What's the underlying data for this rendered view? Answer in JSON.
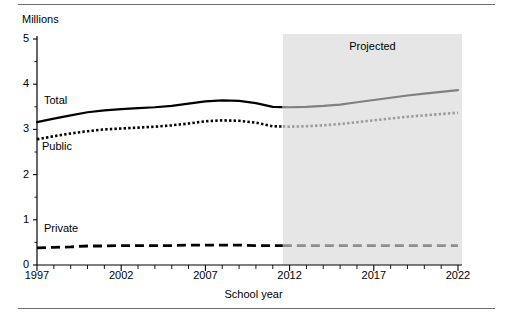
{
  "chart_data": {
    "type": "line",
    "title": "",
    "ylabel": "Millions",
    "xlabel": "School year",
    "xlim": [
      1997,
      2022
    ],
    "ylim": [
      0,
      5
    ],
    "grid": false,
    "legend_position": "inline-labels",
    "y_ticks": [
      "0",
      "1",
      "2",
      "3",
      "4",
      "5"
    ],
    "y_tick_values": [
      0,
      1,
      2,
      3,
      4,
      5
    ],
    "x_ticks": [
      "1997",
      "2002",
      "2007",
      "2012",
      "2017",
      "2022"
    ],
    "x_tick_values": [
      1997,
      2002,
      2007,
      2012,
      2017,
      2022
    ],
    "annotations": [
      {
        "name": "projected-label",
        "text": "Projected",
        "start_year": 2011.6,
        "end_year": 2022
      }
    ],
    "projection_start_year": 2011.6,
    "x": [
      1997,
      1998,
      1999,
      2000,
      2001,
      2002,
      2003,
      2004,
      2005,
      2006,
      2007,
      2008,
      2009,
      2010,
      2011,
      2012,
      2013,
      2014,
      2015,
      2016,
      2017,
      2018,
      2019,
      2020,
      2021,
      2022
    ],
    "series": [
      {
        "name": "Total",
        "label": "Total",
        "color": "#000000",
        "projected_color": "#808080",
        "style": "solid",
        "values": [
          3.16,
          3.24,
          3.31,
          3.38,
          3.42,
          3.45,
          3.47,
          3.49,
          3.52,
          3.57,
          3.62,
          3.64,
          3.63,
          3.58,
          3.5,
          3.49,
          3.5,
          3.52,
          3.55,
          3.6,
          3.65,
          3.7,
          3.75,
          3.79,
          3.83,
          3.87
        ]
      },
      {
        "name": "Public",
        "label": "Public",
        "color": "#000000",
        "projected_color": "#9a9a9a",
        "style": "dotted",
        "values": [
          2.78,
          2.85,
          2.91,
          2.96,
          3.0,
          3.02,
          3.04,
          3.06,
          3.09,
          3.13,
          3.18,
          3.2,
          3.19,
          3.15,
          3.07,
          3.06,
          3.07,
          3.09,
          3.12,
          3.16,
          3.2,
          3.24,
          3.28,
          3.31,
          3.34,
          3.37
        ]
      },
      {
        "name": "Private",
        "label": "Private",
        "color": "#000000",
        "projected_color": "#8e8e8e",
        "style": "dashed",
        "values": [
          0.38,
          0.39,
          0.4,
          0.42,
          0.42,
          0.43,
          0.43,
          0.43,
          0.43,
          0.44,
          0.44,
          0.44,
          0.44,
          0.43,
          0.43,
          0.43,
          0.43,
          0.43,
          0.43,
          0.43,
          0.43,
          0.43,
          0.43,
          0.43,
          0.43,
          0.43
        ]
      }
    ]
  },
  "axis": {
    "y_unit": "Millions",
    "x_title": "School year"
  },
  "labels": {
    "total": "Total",
    "public": "Public",
    "private": "Private",
    "projected": "Projected"
  },
  "colors": {
    "observed": "#000000",
    "projected_line": "#808080",
    "projected_band": "#e6e6e6",
    "axis": "#000000",
    "rule": "#6f6f6f"
  }
}
